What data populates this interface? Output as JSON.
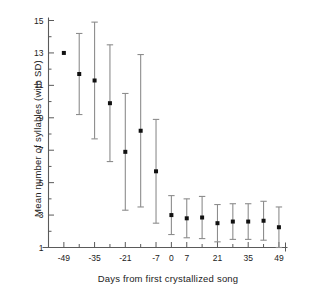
{
  "chart_data": {
    "type": "scatter",
    "title": "",
    "xlabel": "Days from first crystallized song",
    "ylabel": "Mean number of syllables (with SD)",
    "xlim": [
      -56,
      52
    ],
    "ylim": [
      1,
      15
    ],
    "grid": false,
    "legend": null,
    "xticklabels": [
      "-49",
      "-35",
      "-21",
      "-7",
      "0",
      "7",
      "21",
      "35",
      "49"
    ],
    "xtickvalues": [
      -49,
      -35,
      -21,
      -7,
      0,
      7,
      21,
      35,
      49
    ],
    "xminorticks": [
      -42,
      -28,
      -14,
      14,
      28,
      42
    ],
    "yticklabels": [
      "1",
      "3",
      "5",
      "7",
      "9",
      "11",
      "13",
      "15"
    ],
    "ytickvalues": [
      1,
      3,
      5,
      7,
      9,
      11,
      13,
      15
    ],
    "x": [
      -49,
      -42,
      -35,
      -28,
      -21,
      -14,
      -7,
      0,
      7,
      14,
      21,
      28,
      35,
      42,
      49
    ],
    "values": [
      13.0,
      11.7,
      11.3,
      9.9,
      6.9,
      8.2,
      5.7,
      3.0,
      2.8,
      2.85,
      2.5,
      2.6,
      2.6,
      2.65,
      2.25
    ],
    "errors": [
      0.0,
      2.5,
      3.6,
      3.6,
      3.6,
      4.7,
      3.2,
      1.2,
      1.2,
      1.3,
      1.15,
      1.1,
      1.1,
      1.2,
      1.25
    ],
    "series": [
      {
        "name": "Mean number of syllables",
        "marker": "filled-square",
        "errorbar": "SD",
        "points": [
          {
            "x": -49,
            "y": 13.0,
            "sd": 0.0
          },
          {
            "x": -42,
            "y": 11.7,
            "sd": 2.5
          },
          {
            "x": -35,
            "y": 11.3,
            "sd": 3.6
          },
          {
            "x": -28,
            "y": 9.9,
            "sd": 3.6
          },
          {
            "x": -21,
            "y": 6.9,
            "sd": 3.6
          },
          {
            "x": -14,
            "y": 8.2,
            "sd": 4.7
          },
          {
            "x": -7,
            "y": 5.7,
            "sd": 3.2
          },
          {
            "x": 0,
            "y": 3.0,
            "sd": 1.2
          },
          {
            "x": 7,
            "y": 2.8,
            "sd": 1.2
          },
          {
            "x": 14,
            "y": 2.85,
            "sd": 1.3
          },
          {
            "x": 21,
            "y": 2.5,
            "sd": 1.15
          },
          {
            "x": 28,
            "y": 2.6,
            "sd": 1.1
          },
          {
            "x": 35,
            "y": 2.6,
            "sd": 1.1
          },
          {
            "x": 42,
            "y": 2.65,
            "sd": 1.2
          },
          {
            "x": 49,
            "y": 2.25,
            "sd": 1.25
          }
        ]
      }
    ],
    "colors": {
      "marker": "#111111",
      "errorbar": "#8d8d8d",
      "axis": "#5a5a5a",
      "text": "#222222",
      "background": "#ffffff"
    }
  }
}
